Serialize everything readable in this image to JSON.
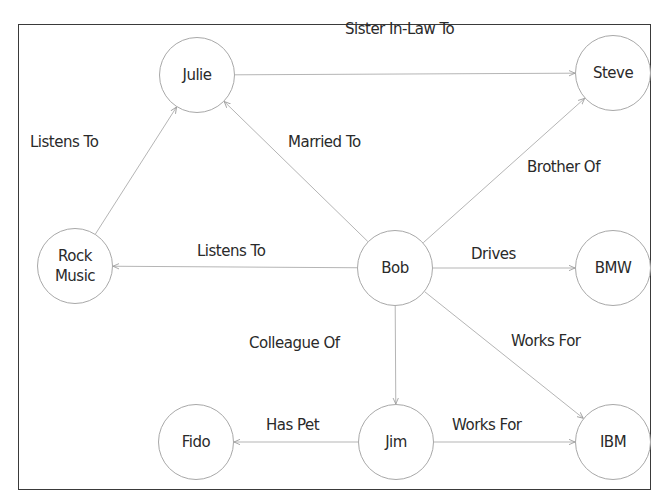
{
  "diagram": {
    "type": "knowledge-graph",
    "nodes": [
      {
        "id": "julie",
        "label": "Julie",
        "cx": 197,
        "cy": 75
      },
      {
        "id": "steve",
        "label": "Steve",
        "cx": 613,
        "cy": 73
      },
      {
        "id": "rock_music",
        "label": "Rock\nMusic",
        "cx": 75,
        "cy": 266
      },
      {
        "id": "bob",
        "label": "Bob",
        "cx": 395,
        "cy": 268
      },
      {
        "id": "bmw",
        "label": "BMW",
        "cx": 613,
        "cy": 268
      },
      {
        "id": "fido",
        "label": "Fido",
        "cx": 196,
        "cy": 442
      },
      {
        "id": "jim",
        "label": "Jim",
        "cx": 396,
        "cy": 442
      },
      {
        "id": "ibm",
        "label": "IBM",
        "cx": 613,
        "cy": 442
      }
    ],
    "edges": [
      {
        "from": "julie",
        "to": "steve",
        "label": "Sister In-Law To",
        "lx": 300,
        "ly": 20
      },
      {
        "from": "rock_music",
        "to": "julie",
        "label": "Listens To",
        "lx": 30,
        "ly": 133
      },
      {
        "from": "bob",
        "to": "julie",
        "label": "Married To",
        "lx": 288,
        "ly": 133
      },
      {
        "from": "bob",
        "to": "steve",
        "label": "Brother Of",
        "lx": 527,
        "ly": 158
      },
      {
        "from": "bob",
        "to": "rock_music",
        "label": "Listens To",
        "lx": 197,
        "ly": 242
      },
      {
        "from": "bob",
        "to": "bmw",
        "label": "Drives",
        "lx": 471,
        "ly": 245
      },
      {
        "from": "bob",
        "to": "jim",
        "label": "Colleague Of",
        "lx": 249,
        "ly": 334
      },
      {
        "from": "bob",
        "to": "ibm",
        "label": "Works For",
        "lx": 511,
        "ly": 332
      },
      {
        "from": "jim",
        "to": "fido",
        "label": "Has Pet",
        "lx": 266,
        "ly": 416
      },
      {
        "from": "jim",
        "to": "ibm",
        "label": "Works For",
        "lx": 452,
        "ly": 416
      }
    ]
  },
  "colors": {
    "frame": "#3a3a3a",
    "node_border": "#a8a8a8",
    "edge": "#b5b5b5",
    "text": "#2a2a2a"
  }
}
